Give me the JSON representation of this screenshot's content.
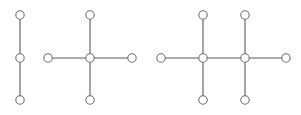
{
  "diagram": {
    "title": "",
    "colors": {
      "edge": "#5a5a5a",
      "node_stroke": "#6e6e6e",
      "node_fill": "#ffffff"
    },
    "graphs": [
      {
        "name": "path-graph-3",
        "nodes": [
          "a",
          "b",
          "c"
        ],
        "edges": [
          [
            "a",
            "b"
          ],
          [
            "b",
            "c"
          ]
        ]
      },
      {
        "name": "star-graph-5",
        "nodes": [
          "top",
          "left",
          "center",
          "right",
          "bottom"
        ],
        "edges": [
          [
            "center",
            "top"
          ],
          [
            "center",
            "left"
          ],
          [
            "center",
            "right"
          ],
          [
            "center",
            "bottom"
          ]
        ]
      },
      {
        "name": "double-star-8",
        "nodes": [
          "left",
          "c1",
          "c2",
          "right",
          "t1",
          "b1",
          "t2",
          "b2"
        ],
        "edges": [
          [
            "left",
            "c1"
          ],
          [
            "c1",
            "c2"
          ],
          [
            "c2",
            "right"
          ],
          [
            "c1",
            "t1"
          ],
          [
            "c1",
            "b1"
          ],
          [
            "c2",
            "t2"
          ],
          [
            "c2",
            "b2"
          ]
        ]
      }
    ]
  }
}
